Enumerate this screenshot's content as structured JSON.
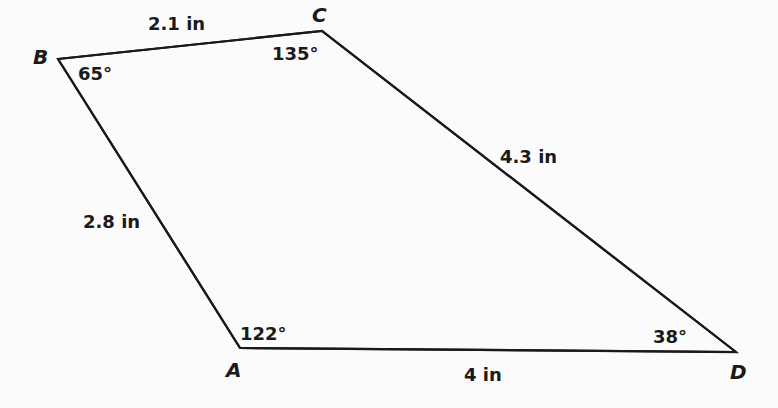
{
  "figure": {
    "type": "quadrilateral",
    "name": "ABCD",
    "line_color": "#1a1a1a",
    "vertices": [
      {
        "id": "A",
        "label": "A",
        "angle": "122°"
      },
      {
        "id": "B",
        "label": "B",
        "angle": "65°"
      },
      {
        "id": "C",
        "label": "C",
        "angle": "135°"
      },
      {
        "id": "D",
        "label": "D",
        "angle": "38°"
      }
    ],
    "sides": [
      {
        "from": "B",
        "to": "C",
        "length": "2.1 in"
      },
      {
        "from": "C",
        "to": "D",
        "length": "4.3 in"
      },
      {
        "from": "A",
        "to": "D",
        "length": "4 in"
      },
      {
        "from": "A",
        "to": "B",
        "length": "2.8 in"
      }
    ]
  }
}
